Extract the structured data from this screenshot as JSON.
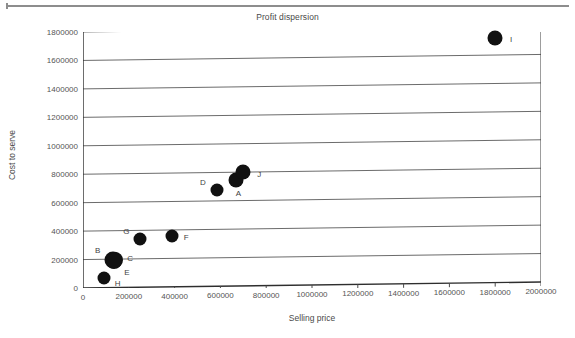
{
  "chart_data": {
    "type": "scatter",
    "title": "Profit dispersion",
    "xlabel": "Selling price",
    "ylabel": "Cost to serve",
    "xlim": [
      0,
      2000000
    ],
    "ylim": [
      0,
      1800000
    ],
    "grid": true,
    "legend": "none",
    "xticks": [
      "0",
      "200000",
      "400000",
      "600000",
      "800000",
      "1000000",
      "1200000",
      "1400000",
      "1600000",
      "1800000",
      "2000000"
    ],
    "yticks": [
      "0",
      "200000",
      "400000",
      "600000",
      "800000",
      "1000000",
      "1200000",
      "1400000",
      "1600000",
      "1800000"
    ],
    "marker_color": "#111111",
    "points": [
      {
        "label": "A",
        "x": 670000,
        "y": 745000,
        "r": 7.5,
        "label_dx": 2,
        "label_dy": 13
      },
      {
        "label": "B",
        "x": 130000,
        "y": 195000,
        "r": 8.5,
        "label_dx": -15,
        "label_dy": -10
      },
      {
        "label": "C",
        "x": 140000,
        "y": 195000,
        "r": 8.0,
        "label_dx": 15,
        "label_dy": -2
      },
      {
        "label": "D",
        "x": 585000,
        "y": 680000,
        "r": 6.5,
        "label_dx": -14,
        "label_dy": -8
      },
      {
        "label": "E",
        "x": 135000,
        "y": 185000,
        "r": 8.0,
        "label_dx": 13,
        "label_dy": 11
      },
      {
        "label": "F",
        "x": 390000,
        "y": 355000,
        "r": 6.5,
        "label_dx": 14,
        "label_dy": 1
      },
      {
        "label": "G",
        "x": 250000,
        "y": 340000,
        "r": 6.5,
        "label_dx": -14,
        "label_dy": -8
      },
      {
        "label": "H",
        "x": 90000,
        "y": 70000,
        "r": 6.5,
        "label_dx": 14,
        "label_dy": 5
      },
      {
        "label": "I",
        "x": 1800000,
        "y": 1720000,
        "r": 7.5,
        "label_dx": 16,
        "label_dy": 1
      },
      {
        "label": "J",
        "x": 700000,
        "y": 800000,
        "r": 7.5,
        "label_dx": 16,
        "label_dy": 2
      }
    ]
  }
}
